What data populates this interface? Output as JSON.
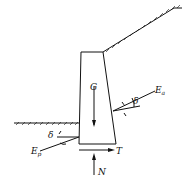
{
  "diagram": {
    "type": "retaining-wall-force-diagram",
    "labels": {
      "weight": "G",
      "active_pressure": "E",
      "active_sub": "a",
      "passive_pressure": "E",
      "passive_sub": "p",
      "friction_angle_active": "δ",
      "friction_angle_passive": "δ",
      "shear_force": "T",
      "normal_force": "N"
    },
    "colors": {
      "line": "#111111",
      "background": "#ffffff"
    }
  }
}
